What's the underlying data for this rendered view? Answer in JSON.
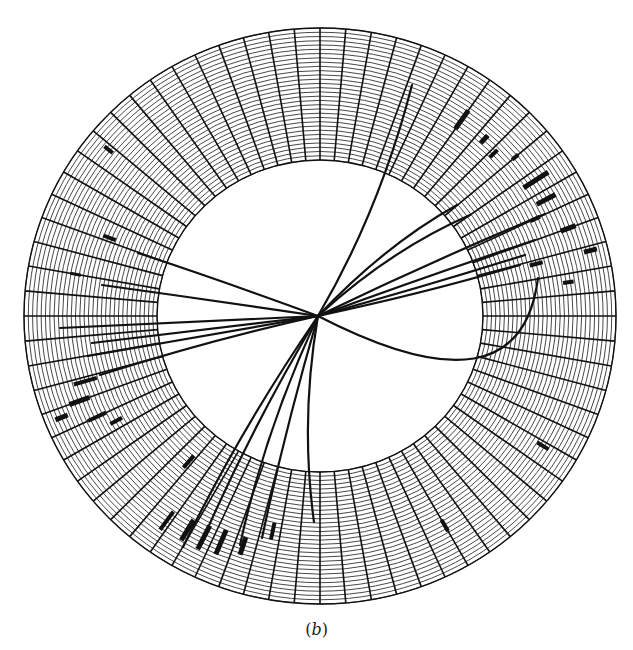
{
  "figure": {
    "caption_open": "(",
    "caption_letter": "b",
    "caption_close": ")",
    "ink_color": "#111111",
    "background": "#ffffff",
    "ring": {
      "center": [
        320,
        316
      ],
      "outer_radius": [
        296,
        288
      ],
      "inner_radius": [
        163,
        156
      ],
      "spoke_count": 72,
      "ring_count": 31
    },
    "filled_cells": [
      {
        "angle": -55,
        "r0": 0.55,
        "r1": 0.72,
        "w": 5
      },
      {
        "angle": -48,
        "r0": 0.58,
        "r1": 0.66,
        "w": 5
      },
      {
        "angle": -44,
        "r0": 0.55,
        "r1": 0.63,
        "w": 4
      },
      {
        "angle": -40,
        "r0": 0.66,
        "r1": 0.72,
        "w": 4
      },
      {
        "angle": -33,
        "r0": 0.6,
        "r1": 0.82,
        "w": 5
      },
      {
        "angle": -28,
        "r0": 0.62,
        "r1": 0.78,
        "w": 5
      },
      {
        "angle": -25,
        "r0": 0.52,
        "r1": 0.6,
        "w": 4
      },
      {
        "angle": -20,
        "r0": 0.7,
        "r1": 0.82,
        "w": 5
      },
      {
        "angle": -14,
        "r0": 0.82,
        "r1": 0.92,
        "w": 5
      },
      {
        "angle": -8,
        "r0": 0.62,
        "r1": 0.7,
        "w": 4
      },
      {
        "angle": -14,
        "r0": 0.4,
        "r1": 0.5,
        "w": 4
      },
      {
        "angle": 31,
        "r0": 0.68,
        "r1": 0.78,
        "w": 4
      },
      {
        "angle": 60,
        "r0": 0.6,
        "r1": 0.7,
        "w": 4
      },
      {
        "angle": 102,
        "r0": 0.42,
        "r1": 0.55,
        "w": 4
      },
      {
        "angle": 108,
        "r0": 0.58,
        "r1": 0.72,
        "w": 5
      },
      {
        "angle": 113,
        "r0": 0.58,
        "r1": 0.78,
        "w": 5
      },
      {
        "angle": 117,
        "r0": 0.6,
        "r1": 0.8,
        "w": 5
      },
      {
        "angle": 121,
        "r0": 0.62,
        "r1": 0.8,
        "w": 5
      },
      {
        "angle": 126,
        "r0": 0.65,
        "r1": 0.82,
        "w": 4
      },
      {
        "angle": 131,
        "r0": 0.22,
        "r1": 0.34,
        "w": 4
      },
      {
        "angle": 155,
        "r0": 0.55,
        "r1": 0.7,
        "w": 4
      },
      {
        "angle": 160,
        "r0": 0.62,
        "r1": 0.78,
        "w": 5
      },
      {
        "angle": 164,
        "r0": 0.52,
        "r1": 0.7,
        "w": 4
      },
      {
        "angle": 158,
        "r0": 0.82,
        "r1": 0.92,
        "w": 5
      },
      {
        "angle": 152,
        "r0": 0.46,
        "r1": 0.56,
        "w": 4
      },
      {
        "angle": 190,
        "r0": 0.6,
        "r1": 0.68,
        "w": 3
      },
      {
        "angle": 201,
        "r0": 0.42,
        "r1": 0.52,
        "w": 4
      },
      {
        "angle": 219,
        "r0": 0.78,
        "r1": 0.86,
        "w": 4
      }
    ],
    "connections": [
      {
        "to": [
          412,
          85
        ],
        "ctrl": [
          380,
          210
        ]
      },
      {
        "to": [
          470,
          215
        ],
        "ctrl": [
          390,
          250
        ]
      },
      {
        "to": [
          457,
          205
        ],
        "ctrl": [
          385,
          245
        ]
      },
      {
        "to": [
          545,
          214
        ],
        "ctrl": [
          430,
          262
        ]
      },
      {
        "to": [
          535,
          240
        ],
        "ctrl": [
          430,
          275
        ]
      },
      {
        "to": [
          525,
          255
        ],
        "ctrl": [
          430,
          285
        ]
      },
      {
        "to": [
          520,
          265
        ],
        "ctrl": [
          430,
          292
        ]
      },
      {
        "to": [
          538,
          278
        ],
        "ctrl": [
          520,
          420
        ],
        "type": "loop"
      },
      {
        "to": [
          138,
          253
        ],
        "ctrl": [
          220,
          280
        ]
      },
      {
        "to": [
          102,
          285
        ],
        "ctrl": [
          210,
          300
        ]
      },
      {
        "to": [
          60,
          328
        ],
        "ctrl": [
          190,
          322
        ]
      },
      {
        "to": [
          92,
          343
        ],
        "ctrl": [
          200,
          330
        ]
      },
      {
        "to": [
          88,
          356
        ],
        "ctrl": [
          200,
          336
        ]
      },
      {
        "to": [
          100,
          375
        ],
        "ctrl": [
          210,
          340
        ]
      },
      {
        "to": [
          183,
          547
        ],
        "ctrl": [
          240,
          430
        ]
      },
      {
        "to": [
          200,
          546
        ],
        "ctrl": [
          250,
          430
        ]
      },
      {
        "to": [
          240,
          545
        ],
        "ctrl": [
          265,
          430
        ]
      },
      {
        "to": [
          262,
          538
        ],
        "ctrl": [
          285,
          430
        ]
      },
      {
        "to": [
          314,
          522
        ],
        "ctrl": [
          300,
          420
        ]
      }
    ],
    "hub": [
      318,
      316
    ]
  }
}
